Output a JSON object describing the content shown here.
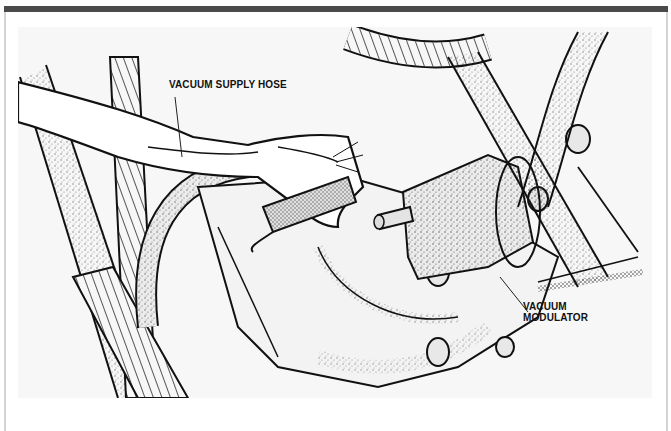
{
  "figure": {
    "type": "technical line illustration",
    "frame": {
      "top_bar_color": "#4a4a4a",
      "border_color": "#d4d4d4",
      "background_color": "#f7f7f7"
    },
    "callouts": [
      {
        "id": "vacuum-supply-hose",
        "label": "VACUUM SUPPLY HOSE"
      },
      {
        "id": "vacuum-modulator",
        "label_line1": "VACUUM",
        "label_line2": "MODULATOR"
      }
    ]
  }
}
